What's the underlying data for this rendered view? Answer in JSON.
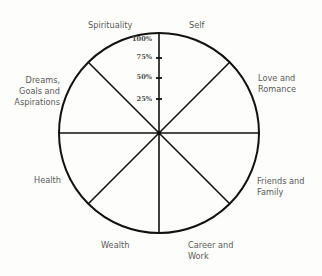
{
  "wheel": {
    "title": "",
    "segments": [
      {
        "label": "Self"
      },
      {
        "label": "Love and\nRomance"
      },
      {
        "label": "Friends and\nFamily"
      },
      {
        "label": "Career and\nWork"
      },
      {
        "label": "Wealth"
      },
      {
        "label": "Health"
      },
      {
        "label": "Dreams,\nGoals and\nAspirations"
      },
      {
        "label": "Spirituality"
      }
    ],
    "labels": {
      "self": "Self",
      "love_1": "Love and",
      "love_2": "Romance",
      "friends_1": "Friends and",
      "friends_2": "Family",
      "career_1": "Career and",
      "career_2": "Work",
      "wealth": "Wealth",
      "health": "Health",
      "dreams_1": "Dreams,",
      "dreams_2": "Goals and",
      "dreams_3": "Aspirations",
      "spirituality": "Spirituality"
    },
    "scale": {
      "ticks": [
        {
          "value": 1.0,
          "label": "100%"
        },
        {
          "value": 0.75,
          "label": "75%"
        },
        {
          "value": 0.5,
          "label": "50%"
        },
        {
          "value": 0.25,
          "label": "25%"
        }
      ]
    },
    "colors": {
      "stroke": "#111111",
      "text": "#5a5a5a",
      "background": "#fdfdfb"
    }
  }
}
